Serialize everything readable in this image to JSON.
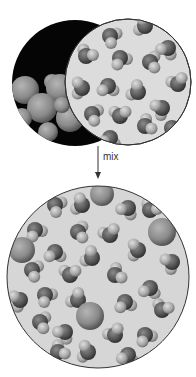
{
  "diagram": {
    "arrow_label": "mix",
    "colors": {
      "background": "#ffffff",
      "pure_bg_dark": "#050505",
      "pure_bg_light": "#dcdcdc",
      "mix_bg": "#d6d6d6",
      "outline": "#333333",
      "large_sphere": "#8a8a8a",
      "water_o": "#555555",
      "water_h": "#a8a8a8"
    },
    "left_circle": {
      "cx": 75,
      "cy": 83,
      "r": 63,
      "label": "substance A (large spheres)"
    },
    "right_circle": {
      "cx": 128,
      "cy": 82,
      "r": 63,
      "label": "substance B (water molecules)"
    },
    "mix_circle": {
      "cx": 98,
      "cy": 277,
      "r": 91,
      "label": "mixture"
    },
    "arrow": {
      "x": 98,
      "y1": 146,
      "y2": 178
    },
    "left_spheres": [
      {
        "x": 25,
        "y": 90,
        "r": 14
      },
      {
        "x": 52,
        "y": 82,
        "r": 8
      },
      {
        "x": 60,
        "y": 88,
        "r": 14
      },
      {
        "x": 42,
        "y": 108,
        "r": 15
      },
      {
        "x": 22,
        "y": 118,
        "r": 10
      },
      {
        "x": 70,
        "y": 118,
        "r": 14
      },
      {
        "x": 48,
        "y": 132,
        "r": 10
      },
      {
        "x": 62,
        "y": 105,
        "r": 8
      },
      {
        "x": 85,
        "y": 100,
        "r": 10
      }
    ],
    "right_molecules": [
      {
        "x": 110,
        "y": 36,
        "a": 30
      },
      {
        "x": 145,
        "y": 26,
        "a": 200
      },
      {
        "x": 168,
        "y": 48,
        "a": 120
      },
      {
        "x": 86,
        "y": 56,
        "a": 300
      },
      {
        "x": 120,
        "y": 58,
        "a": 60
      },
      {
        "x": 150,
        "y": 62,
        "a": 0
      },
      {
        "x": 178,
        "y": 84,
        "a": 250
      },
      {
        "x": 82,
        "y": 88,
        "a": 180
      },
      {
        "x": 108,
        "y": 86,
        "a": 90
      },
      {
        "x": 138,
        "y": 92,
        "a": 210
      },
      {
        "x": 162,
        "y": 108,
        "a": 150
      },
      {
        "x": 92,
        "y": 114,
        "a": 20
      },
      {
        "x": 120,
        "y": 116,
        "a": 270
      },
      {
        "x": 145,
        "y": 126,
        "a": 330
      },
      {
        "x": 110,
        "y": 138,
        "a": 100
      },
      {
        "x": 172,
        "y": 128,
        "a": 45
      }
    ],
    "mix_spheres": [
      {
        "x": 102,
        "y": 194,
        "r": 12
      },
      {
        "x": 162,
        "y": 232,
        "r": 14
      },
      {
        "x": 22,
        "y": 250,
        "r": 13
      },
      {
        "x": 90,
        "y": 316,
        "r": 14
      }
    ],
    "mix_molecules": [
      {
        "x": 55,
        "y": 205,
        "a": 30
      },
      {
        "x": 82,
        "y": 205,
        "a": 200
      },
      {
        "x": 128,
        "y": 208,
        "a": 120
      },
      {
        "x": 150,
        "y": 210,
        "a": 300
      },
      {
        "x": 35,
        "y": 230,
        "a": 60
      },
      {
        "x": 78,
        "y": 232,
        "a": 0
      },
      {
        "x": 110,
        "y": 235,
        "a": 250
      },
      {
        "x": 138,
        "y": 250,
        "a": 180
      },
      {
        "x": 55,
        "y": 252,
        "a": 90
      },
      {
        "x": 92,
        "y": 258,
        "a": 210
      },
      {
        "x": 172,
        "y": 262,
        "a": 150
      },
      {
        "x": 32,
        "y": 270,
        "a": 20
      },
      {
        "x": 70,
        "y": 275,
        "a": 270
      },
      {
        "x": 115,
        "y": 275,
        "a": 330
      },
      {
        "x": 150,
        "y": 288,
        "a": 100
      },
      {
        "x": 45,
        "y": 295,
        "a": 45
      },
      {
        "x": 20,
        "y": 300,
        "a": 160
      },
      {
        "x": 78,
        "y": 300,
        "a": 220
      },
      {
        "x": 125,
        "y": 302,
        "a": 80
      },
      {
        "x": 162,
        "y": 310,
        "a": 290
      },
      {
        "x": 40,
        "y": 322,
        "a": 10
      },
      {
        "x": 65,
        "y": 332,
        "a": 130
      },
      {
        "x": 115,
        "y": 335,
        "a": 240
      },
      {
        "x": 145,
        "y": 335,
        "a": 60
      },
      {
        "x": 88,
        "y": 352,
        "a": 190
      },
      {
        "x": 58,
        "y": 352,
        "a": 320
      },
      {
        "x": 128,
        "y": 355,
        "a": 100
      }
    ]
  }
}
